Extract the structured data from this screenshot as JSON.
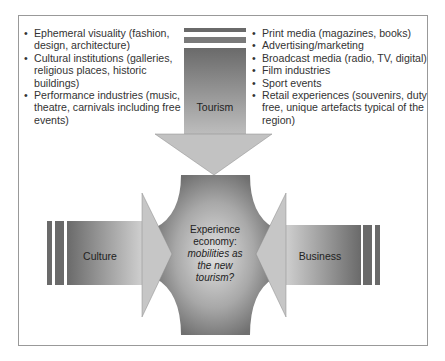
{
  "diagram": {
    "left_list": [
      "Ephemeral visuality (fashion, design, architecture)",
      "Cultural institutions (galleries, religious places, historic buildings)",
      "Performance industries (music, theatre, carnivals including free events)"
    ],
    "right_list": [
      "Print media (magazines, books)",
      "Advertising/marketing",
      "Broadcast media (radio, TV, digital)",
      "Film industries",
      "Sport events",
      "Retail experiences (souvenirs, duty free, unique artefacts typical of the region)"
    ],
    "arrows": {
      "top": "Tourism",
      "left": "Culture",
      "right": "Business"
    },
    "center": {
      "line1": "Experience",
      "line2": "economy:",
      "line3": "mobilities as",
      "line4": "the new",
      "line5": "tourism?"
    },
    "colors": {
      "dark": "#6e6e6e",
      "light": "#d8d8d8",
      "border": "#999999"
    }
  }
}
